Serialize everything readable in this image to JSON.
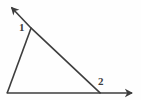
{
  "figure": {
    "background_color": "#fefefe",
    "stroke_color": "#3d3d3d",
    "stroke_width": 1.6,
    "width": 141,
    "height": 100,
    "labels": [
      {
        "id": "1",
        "text": "1",
        "x": 19,
        "y": 22,
        "describes": "angle-at-upper-left-vertex"
      },
      {
        "id": "2",
        "text": "2",
        "x": 98,
        "y": 76,
        "describes": "angle-at-lower-right-vertex"
      }
    ],
    "vertices": {
      "upper_left": {
        "x": 31,
        "y": 28
      },
      "lower_left": {
        "x": 7,
        "y": 93
      },
      "lower_right": {
        "x": 100,
        "y": 93
      }
    },
    "segments": [
      {
        "name": "ray-up-left",
        "from": {
          "x": 31,
          "y": 28
        },
        "to": {
          "x": 8,
          "y": 4
        },
        "arrow": true
      },
      {
        "name": "diagonal-transversal",
        "from": {
          "x": 31,
          "y": 28
        },
        "to": {
          "x": 100,
          "y": 93
        },
        "arrow": false
      },
      {
        "name": "left-side",
        "from": {
          "x": 31,
          "y": 28
        },
        "to": {
          "x": 7,
          "y": 93
        },
        "arrow": false
      },
      {
        "name": "base-ray-right",
        "from": {
          "x": 7,
          "y": 93
        },
        "to": {
          "x": 136,
          "y": 93
        },
        "arrow": true
      }
    ]
  }
}
